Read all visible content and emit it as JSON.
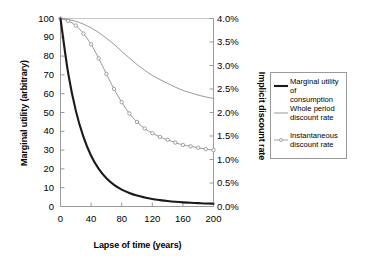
{
  "chart_data": {
    "type": "line",
    "title": "",
    "xlabel": "Lapse of time (years)",
    "ylabel": "Marginal utility (arbitrary)",
    "y2label": "Implicit discount rate",
    "xlim": [
      0,
      200
    ],
    "ylim": [
      0,
      100
    ],
    "y2lim": [
      0.0,
      4.0
    ],
    "grid": false,
    "legend_position": "right",
    "xticks": [
      "0",
      "40",
      "80",
      "120",
      "160",
      "200"
    ],
    "xtick_values": [
      0,
      40,
      80,
      120,
      160,
      200
    ],
    "yticks": [
      "0",
      "10",
      "20",
      "30",
      "40",
      "50",
      "60",
      "70",
      "80",
      "90",
      "100"
    ],
    "ytick_values": [
      0,
      10,
      20,
      30,
      40,
      50,
      60,
      70,
      80,
      90,
      100
    ],
    "y2ticks": [
      "0.0%",
      "0.5%",
      "1.0%",
      "1.5%",
      "2.0%",
      "2.5%",
      "3.0%",
      "3.5%",
      "4.0%"
    ],
    "y2tick_values": [
      0.0,
      0.5,
      1.0,
      1.5,
      2.0,
      2.5,
      3.0,
      3.5,
      4.0
    ],
    "x": [
      0,
      10,
      20,
      30,
      40,
      50,
      60,
      70,
      80,
      90,
      100,
      110,
      120,
      130,
      140,
      150,
      160,
      170,
      180,
      190,
      200
    ],
    "series": [
      {
        "name": "Marginal utility of consumption",
        "axis": "left",
        "color": "#1a1a1a",
        "style": "solid-thick",
        "marker": "none",
        "values": [
          100,
          71,
          51,
          37,
          27,
          20,
          15,
          11.5,
          9,
          7.2,
          5.8,
          4.8,
          4.0,
          3.4,
          2.9,
          2.5,
          2.2,
          2.0,
          1.8,
          1.6,
          1.5
        ]
      },
      {
        "name": "Whole period discount rate",
        "axis": "right",
        "color": "#8c8c8c",
        "style": "solid-thin",
        "marker": "none",
        "values": [
          4.0,
          3.98,
          3.94,
          3.88,
          3.8,
          3.7,
          3.58,
          3.45,
          3.3,
          3.16,
          3.02,
          2.9,
          2.79,
          2.7,
          2.62,
          2.54,
          2.47,
          2.42,
          2.37,
          2.33,
          2.3
        ]
      },
      {
        "name": "Instantaneous discount rate",
        "axis": "right",
        "color": "#8c8c8c",
        "style": "solid-marker",
        "marker": "circle",
        "values": [
          4.0,
          3.95,
          3.85,
          3.68,
          3.45,
          3.15,
          2.82,
          2.5,
          2.22,
          1.98,
          1.8,
          1.66,
          1.56,
          1.48,
          1.42,
          1.36,
          1.31,
          1.28,
          1.25,
          1.22,
          1.2
        ]
      }
    ]
  },
  "legend": {
    "entries": [
      {
        "label": "Marginal utility of\nconsumption"
      },
      {
        "label": "Whole period\ndiscount rate"
      },
      {
        "label": "Instantaneous\ndiscount rate"
      }
    ]
  },
  "colors": {
    "series_1": "#1a1a1a",
    "series_2": "#8c8c8c",
    "series_3": "#8c8c8c",
    "axis": "#9a9a9a",
    "background": "#ffffff"
  }
}
